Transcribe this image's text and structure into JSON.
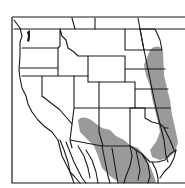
{
  "map": {
    "title": "Species range map",
    "region": "Western United States and northern Mexico",
    "colors": {
      "background": "#ffffff",
      "border": "#1a1a1a",
      "range_fill": "#9a9a9a"
    },
    "legend": null
  }
}
